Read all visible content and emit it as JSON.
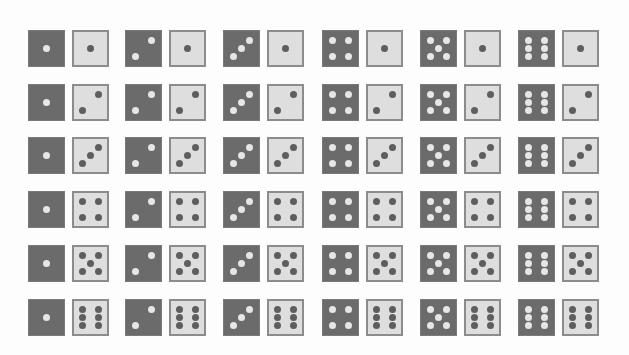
{
  "colors": {
    "background": "#fdfdfd",
    "dark_die_face": "#6b6b6b",
    "dark_die_pip": "#e6e6e6",
    "light_die_face": "#dedede",
    "light_die_border": "#8c8c8c",
    "light_die_pip": "#5e5e5e"
  },
  "layout": {
    "columns": 6,
    "rows": 6,
    "col_x": [
      28,
      125,
      223,
      322,
      420,
      518
    ],
    "row_y": [
      30,
      84,
      137,
      191,
      245,
      299
    ]
  },
  "grid": {
    "description": "Dark die value varies by column (1-6); light die value varies by row (1-6).",
    "rows": [
      {
        "light": 1,
        "pairs": [
          {
            "dark": 1,
            "light": 1
          },
          {
            "dark": 2,
            "light": 1
          },
          {
            "dark": 3,
            "light": 1
          },
          {
            "dark": 4,
            "light": 1
          },
          {
            "dark": 5,
            "light": 1
          },
          {
            "dark": 6,
            "light": 1
          }
        ]
      },
      {
        "light": 2,
        "pairs": [
          {
            "dark": 1,
            "light": 2
          },
          {
            "dark": 2,
            "light": 2
          },
          {
            "dark": 3,
            "light": 2
          },
          {
            "dark": 4,
            "light": 2
          },
          {
            "dark": 5,
            "light": 2
          },
          {
            "dark": 6,
            "light": 2
          }
        ]
      },
      {
        "light": 3,
        "pairs": [
          {
            "dark": 1,
            "light": 3
          },
          {
            "dark": 2,
            "light": 3
          },
          {
            "dark": 3,
            "light": 3
          },
          {
            "dark": 4,
            "light": 3
          },
          {
            "dark": 5,
            "light": 3
          },
          {
            "dark": 6,
            "light": 3
          }
        ]
      },
      {
        "light": 4,
        "pairs": [
          {
            "dark": 1,
            "light": 4
          },
          {
            "dark": 2,
            "light": 4
          },
          {
            "dark": 3,
            "light": 4
          },
          {
            "dark": 4,
            "light": 4
          },
          {
            "dark": 5,
            "light": 4
          },
          {
            "dark": 6,
            "light": 4
          }
        ]
      },
      {
        "light": 5,
        "pairs": [
          {
            "dark": 1,
            "light": 5
          },
          {
            "dark": 2,
            "light": 5
          },
          {
            "dark": 3,
            "light": 5
          },
          {
            "dark": 4,
            "light": 5
          },
          {
            "dark": 5,
            "light": 5
          },
          {
            "dark": 6,
            "light": 5
          }
        ]
      },
      {
        "light": 6,
        "pairs": [
          {
            "dark": 1,
            "light": 6
          },
          {
            "dark": 2,
            "light": 6
          },
          {
            "dark": 3,
            "light": 6
          },
          {
            "dark": 4,
            "light": 6
          },
          {
            "dark": 5,
            "light": 6
          },
          {
            "dark": 6,
            "light": 6
          }
        ]
      }
    ]
  }
}
